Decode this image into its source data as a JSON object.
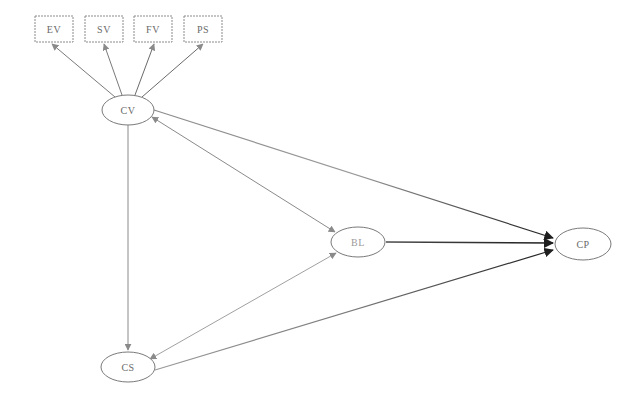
{
  "diagram": {
    "type": "structural-equation-model",
    "observed_indicators": [
      {
        "id": "EV",
        "label": "EV",
        "x": 35,
        "y": 16,
        "w": 38,
        "h": 26
      },
      {
        "id": "SV",
        "label": "SV",
        "x": 85,
        "y": 16,
        "w": 38,
        "h": 26
      },
      {
        "id": "FV",
        "label": "FV",
        "x": 134,
        "y": 16,
        "w": 38,
        "h": 26
      },
      {
        "id": "PS",
        "label": "PS",
        "x": 184,
        "y": 16,
        "w": 38,
        "h": 26
      }
    ],
    "latent_constructs": [
      {
        "id": "CV",
        "label": "CV",
        "cx": 128,
        "cy": 110,
        "rx": 26,
        "ry": 15
      },
      {
        "id": "BL",
        "label": "BL",
        "cx": 358,
        "cy": 242,
        "rx": 27,
        "ry": 15
      },
      {
        "id": "CP",
        "label": "CP",
        "cx": 583,
        "cy": 244,
        "rx": 28,
        "ry": 16
      },
      {
        "id": "CS",
        "label": "CS",
        "cx": 128,
        "cy": 367,
        "rx": 27,
        "ry": 15
      }
    ],
    "edges": [
      {
        "from": "CV",
        "to": "EV",
        "kind": "loading",
        "double": false
      },
      {
        "from": "CV",
        "to": "SV",
        "kind": "loading",
        "double": false
      },
      {
        "from": "CV",
        "to": "FV",
        "kind": "loading",
        "double": false
      },
      {
        "from": "CV",
        "to": "PS",
        "kind": "loading",
        "double": false
      },
      {
        "from": "CV",
        "to": "CS",
        "kind": "path",
        "double": false
      },
      {
        "from": "CV",
        "to": "BL",
        "kind": "path",
        "double": true
      },
      {
        "from": "CV",
        "to": "CP",
        "kind": "path",
        "double": false
      },
      {
        "from": "CS",
        "to": "BL",
        "kind": "path",
        "double": true
      },
      {
        "from": "CS",
        "to": "CP",
        "kind": "path",
        "double": false
      },
      {
        "from": "BL",
        "to": "CP",
        "kind": "path",
        "double": false
      }
    ],
    "colors": {
      "background": "#ffffff",
      "node_stroke": "#7a7a7a",
      "label": "#6a6a6a",
      "edge_light": "#9a9a9a",
      "edge_dark": "#2a2a2a"
    }
  }
}
